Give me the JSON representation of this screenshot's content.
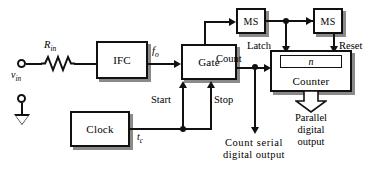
{
  "diagram": {
    "blocks": {
      "ifc": "IFC",
      "gate": "Gate",
      "clock": "Clock",
      "ms1": "MS",
      "ms2": "MS",
      "counter": "Counter",
      "counter_inner": "n"
    },
    "signal_labels": {
      "r_in_symbol": "R",
      "r_in_sub": "in",
      "v_in_symbol": "v",
      "v_in_sub": "in",
      "f_o_symbol": "f",
      "f_o_sub": "o",
      "t_c_symbol": "t",
      "t_c_sub": "c",
      "start": "Start",
      "stop": "Stop",
      "count": "Count",
      "latch": "Latch",
      "reset": "Reset"
    },
    "outputs": {
      "parallel_line1": "Parallel",
      "parallel_line2": "digital",
      "parallel_line3": "output",
      "serial_line1": "Count serial",
      "serial_line2": "digital output"
    },
    "colors": {
      "ink": "#111111",
      "shadow": "#8a8a8a",
      "paper": "#ffffff"
    }
  }
}
